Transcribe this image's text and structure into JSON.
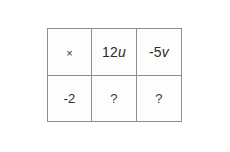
{
  "grid": {
    "rows": [
      {
        "cells": [
          {
            "type": "operator",
            "text": "×"
          },
          {
            "type": "term",
            "coefficient": "12",
            "variable": "u"
          },
          {
            "type": "term",
            "coefficient": "-5",
            "variable": "v"
          }
        ]
      },
      {
        "cells": [
          {
            "type": "number",
            "text": "-2"
          },
          {
            "type": "unknown",
            "text": "?"
          },
          {
            "type": "unknown",
            "text": "?"
          }
        ]
      }
    ]
  },
  "colors": {
    "border": "#8e8e8e",
    "text": "#2b2b2b",
    "cell_background": "#fdfdfd",
    "page_background": "#ffffff"
  }
}
